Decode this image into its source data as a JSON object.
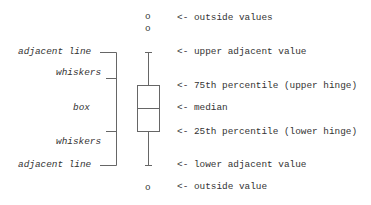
{
  "diagram": {
    "type": "boxplot-anatomy",
    "line_color": "#666666",
    "text_color": "#333333",
    "left_labels": [
      {
        "id": "adjacent-line-upper",
        "text": "adjacent line"
      },
      {
        "id": "whiskers-upper",
        "text": "whiskers"
      },
      {
        "id": "box",
        "text": "box"
      },
      {
        "id": "whiskers-lower",
        "text": "whiskers"
      },
      {
        "id": "adjacent-line-lower",
        "text": "adjacent line"
      }
    ],
    "right_labels": [
      {
        "id": "outside-values-upper",
        "text": "<- outside values"
      },
      {
        "id": "upper-adjacent-value",
        "text": "<- upper adjacent value"
      },
      {
        "id": "upper-hinge",
        "text": "<- 75th percentile (upper hinge)"
      },
      {
        "id": "median",
        "text": "<- median"
      },
      {
        "id": "lower-hinge",
        "text": "<- 25th percentile (lower hinge)"
      },
      {
        "id": "lower-adjacent-value",
        "text": "<- lower adjacent value"
      },
      {
        "id": "outside-value-lower",
        "text": "<- outside value"
      }
    ],
    "markers": {
      "outside_upper": [
        "o",
        "o"
      ],
      "outside_lower": [
        "o"
      ]
    }
  }
}
